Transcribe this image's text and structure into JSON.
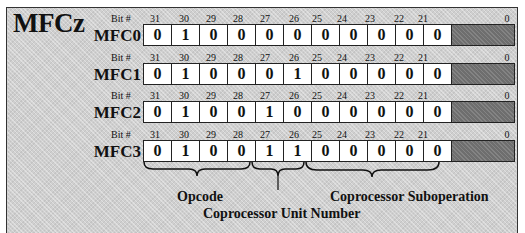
{
  "diagram": {
    "title": "MFCz",
    "bit_prefix": "Bit #",
    "bit_numbers": [
      "31",
      "30",
      "29",
      "28",
      "27",
      "26",
      "25",
      "24",
      "23",
      "22",
      "21"
    ],
    "last_bit": "0",
    "registers": [
      {
        "label": "MFC0",
        "bits": [
          "0",
          "1",
          "0",
          "0",
          "0",
          "0",
          "0",
          "0",
          "0",
          "0",
          "0"
        ]
      },
      {
        "label": "MFC1",
        "bits": [
          "0",
          "1",
          "0",
          "0",
          "0",
          "1",
          "0",
          "0",
          "0",
          "0",
          "0"
        ]
      },
      {
        "label": "MFC2",
        "bits": [
          "0",
          "1",
          "0",
          "0",
          "1",
          "0",
          "0",
          "0",
          "0",
          "0",
          "0"
        ]
      },
      {
        "label": "MFC3",
        "bits": [
          "0",
          "1",
          "0",
          "0",
          "1",
          "1",
          "0",
          "0",
          "0",
          "0",
          "0"
        ]
      }
    ],
    "fields": {
      "opcode": "Opcode",
      "unit_number": "Coprocessor Unit Number",
      "suboperation": "Coprocessor Suboperation"
    },
    "colors": {
      "background": "#cfcfcf",
      "filler": "#6e6e6e",
      "cell": "#ffffff",
      "border": "#222222"
    }
  }
}
